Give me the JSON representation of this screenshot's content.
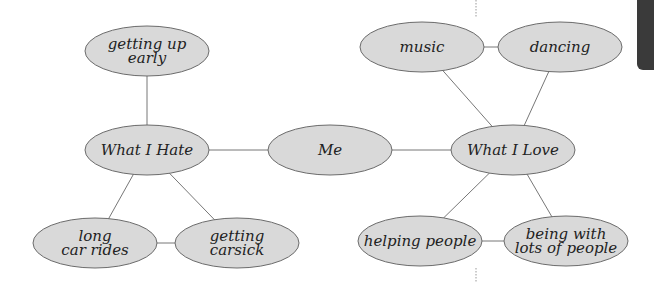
{
  "diagram": {
    "type": "concept-web",
    "colors": {
      "node_fill": "#d9d9d9",
      "node_stroke": "#6b6b6b",
      "edge": "#777777",
      "text": "#222222",
      "tab": "#3a3a3a"
    },
    "nodes": [
      {
        "id": "me",
        "lines": [
          "Me"
        ],
        "cx": 330,
        "cy": 150
      },
      {
        "id": "what_i_hate",
        "lines": [
          "What I Hate"
        ],
        "cx": 147,
        "cy": 150
      },
      {
        "id": "what_i_love",
        "lines": [
          "What I Love"
        ],
        "cx": 513,
        "cy": 150
      },
      {
        "id": "getting_up_early",
        "lines": [
          "getting up",
          "early"
        ],
        "cx": 147,
        "cy": 51
      },
      {
        "id": "long_car_rides",
        "lines": [
          "long",
          "car rides"
        ],
        "cx": 95,
        "cy": 243
      },
      {
        "id": "getting_carsick",
        "lines": [
          "getting",
          "carsick"
        ],
        "cx": 237,
        "cy": 243
      },
      {
        "id": "music",
        "lines": [
          "music"
        ],
        "cx": 422,
        "cy": 47
      },
      {
        "id": "dancing",
        "lines": [
          "dancing"
        ],
        "cx": 560,
        "cy": 47
      },
      {
        "id": "helping_people",
        "lines": [
          "helping people"
        ],
        "cx": 420,
        "cy": 241
      },
      {
        "id": "being_with_lots_of_people",
        "lines": [
          "being with",
          "lots of people"
        ],
        "cx": 566,
        "cy": 241
      }
    ],
    "edges": [
      [
        "what_i_hate",
        "me"
      ],
      [
        "me",
        "what_i_love"
      ],
      [
        "getting_up_early",
        "what_i_hate"
      ],
      [
        "what_i_hate",
        "long_car_rides"
      ],
      [
        "what_i_hate",
        "getting_carsick"
      ],
      [
        "long_car_rides",
        "getting_carsick"
      ],
      [
        "music",
        "dancing"
      ],
      [
        "music",
        "what_i_love"
      ],
      [
        "dancing",
        "what_i_love"
      ],
      [
        "what_i_love",
        "helping_people"
      ],
      [
        "what_i_love",
        "being_with_lots_of_people"
      ],
      [
        "helping_people",
        "being_with_lots_of_people"
      ]
    ]
  }
}
